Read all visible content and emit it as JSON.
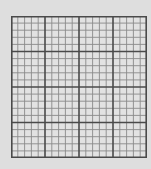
{
  "graph_paper": {
    "major_columns": 4,
    "major_rows": 4,
    "minor_per_major": 5,
    "total_columns": 20,
    "total_rows": 20,
    "colors": {
      "background": "#dedede",
      "cell_fill": "#e2e2e2",
      "minor_line": "#8a8a8a",
      "major_line": "#4a4a4a"
    }
  }
}
